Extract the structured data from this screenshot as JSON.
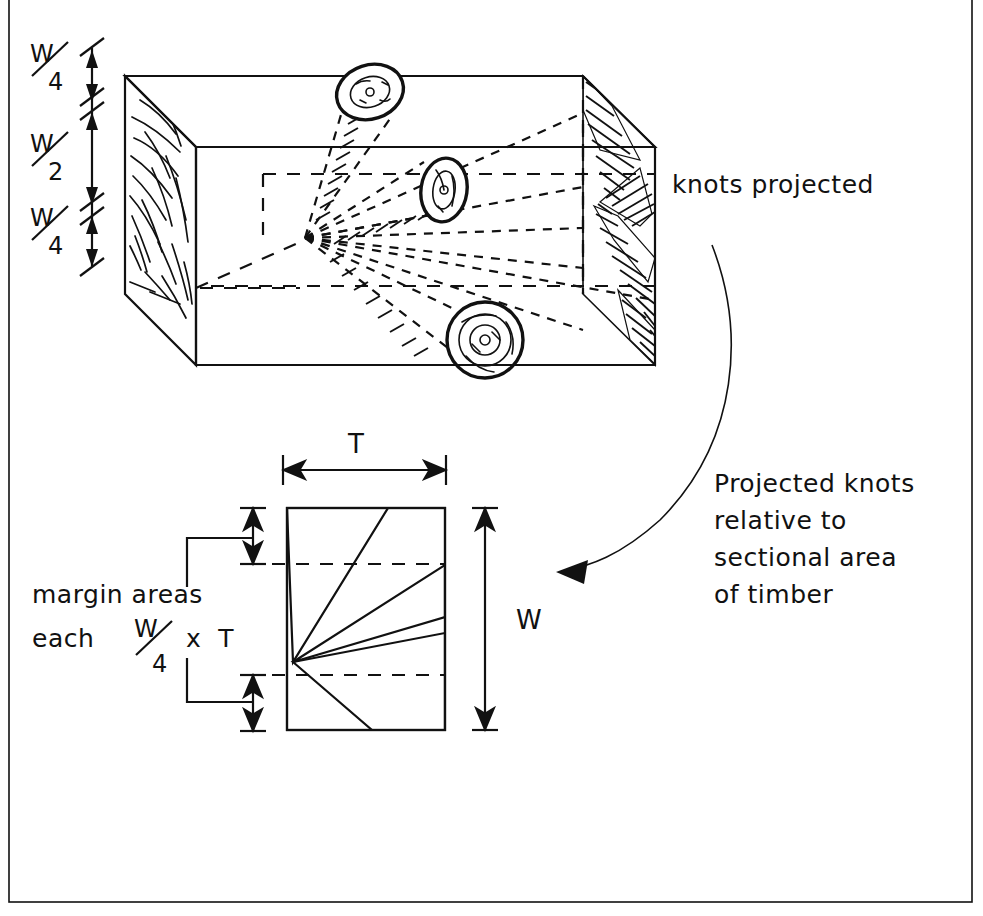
{
  "figure": {
    "title_visible": false,
    "background_color": "#ffffff",
    "ink_color": "#111111",
    "border": {
      "present": true,
      "style": "thin rectangular frame"
    }
  },
  "upper_diagram": {
    "name": "isometric-timber-block",
    "description_visible": "three-dimensional timber piece with knots radiating from pith",
    "left_dimensions": [
      {
        "id": "top",
        "numerator": "W",
        "denominator": "4"
      },
      {
        "id": "middle",
        "numerator": "W",
        "denominator": "2"
      },
      {
        "id": "bottom",
        "numerator": "W",
        "denominator": "4"
      }
    ],
    "callout_right": "knots projected",
    "knots": [
      {
        "id": "knot-upper",
        "shape": "ellipse"
      },
      {
        "id": "knot-middle",
        "shape": "ellipse"
      },
      {
        "id": "knot-lower",
        "shape": "circle"
      }
    ]
  },
  "annotation": {
    "name": "projected-knots-note",
    "lines": [
      "Projected knots",
      "relative to",
      "sectional area",
      "of timber"
    ],
    "arrow": "curved leader arrow pointing to cross-section"
  },
  "lower_diagram": {
    "name": "cross-section-of-timber",
    "width_label": "T",
    "height_label": "W",
    "margin_note": {
      "line1": "margin areas",
      "line2_prefix": "each",
      "fraction_numerator": "W",
      "fraction_denominator": "4",
      "line2_suffix": "x  T"
    },
    "margin_dimensions": [
      {
        "id": "top-margin",
        "numerator": "W",
        "denominator": "4"
      },
      {
        "id": "bottom-margin",
        "numerator": "W",
        "denominator": "4"
      }
    ],
    "wedges_count": 3,
    "wedge_fill": "stippled"
  }
}
